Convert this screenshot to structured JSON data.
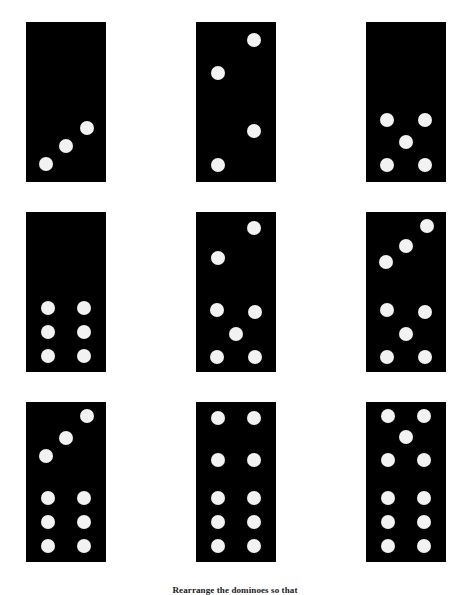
{
  "page": {
    "background_color": "#ffffff",
    "width": 470,
    "height": 595
  },
  "caption": {
    "text": "Rearrange the dominoes so that"
  },
  "style": {
    "tile_color": "#000000",
    "pip_color": "#f2f2f2"
  },
  "puzzle": {
    "type": "domino-grid",
    "rows": 3,
    "columns": 3,
    "tile_count": 9
  },
  "dominoes": [
    {
      "index": 1,
      "row": 1,
      "col": 1,
      "x": 26,
      "y": 22,
      "w": 80,
      "h": 160,
      "top_value": 0,
      "bottom_value": 3,
      "total": 3,
      "top_layout": "blank",
      "bottom_layout": "diagonal-3-up",
      "top_pips": [],
      "bottom_pips": [
        [
          0.25,
          0.78
        ],
        [
          0.5,
          0.55
        ],
        [
          0.76,
          0.33
        ]
      ]
    },
    {
      "index": 2,
      "row": 1,
      "col": 2,
      "x": 196,
      "y": 22,
      "w": 80,
      "h": 160,
      "top_value": 2,
      "bottom_value": 2,
      "total": 4,
      "top_layout": "diagonal-2",
      "bottom_layout": "diagonal-2",
      "top_pips": [
        [
          0.73,
          0.23
        ],
        [
          0.27,
          0.64
        ]
      ],
      "bottom_pips": [
        [
          0.73,
          0.36
        ],
        [
          0.27,
          0.79
        ]
      ]
    },
    {
      "index": 3,
      "row": 1,
      "col": 3,
      "x": 366,
      "y": 22,
      "w": 80,
      "h": 160,
      "top_value": 0,
      "bottom_value": 5,
      "total": 5,
      "top_layout": "blank",
      "bottom_layout": "quincunx-5",
      "top_pips": [],
      "bottom_pips": [
        [
          0.26,
          0.23
        ],
        [
          0.74,
          0.23
        ],
        [
          0.5,
          0.5
        ],
        [
          0.26,
          0.79
        ],
        [
          0.74,
          0.79
        ]
      ]
    },
    {
      "index": 4,
      "row": 2,
      "col": 1,
      "x": 26,
      "y": 212,
      "w": 80,
      "h": 160,
      "top_value": 0,
      "bottom_value": 6,
      "total": 6,
      "top_layout": "blank",
      "bottom_layout": "two-columns-6",
      "top_pips": [],
      "bottom_pips": [
        [
          0.27,
          0.2
        ],
        [
          0.73,
          0.2
        ],
        [
          0.27,
          0.5
        ],
        [
          0.73,
          0.5
        ],
        [
          0.27,
          0.8
        ],
        [
          0.73,
          0.8
        ]
      ]
    },
    {
      "index": 5,
      "row": 2,
      "col": 2,
      "x": 196,
      "y": 212,
      "w": 80,
      "h": 160,
      "top_value": 2,
      "bottom_value": 5,
      "total": 7,
      "top_layout": "diagonal-2",
      "bottom_layout": "quincunx-5",
      "top_pips": [
        [
          0.73,
          0.2
        ],
        [
          0.27,
          0.57
        ]
      ],
      "bottom_pips": [
        [
          0.26,
          0.22
        ],
        [
          0.74,
          0.25
        ],
        [
          0.5,
          0.53
        ],
        [
          0.26,
          0.81
        ],
        [
          0.74,
          0.81
        ]
      ]
    },
    {
      "index": 6,
      "row": 2,
      "col": 3,
      "x": 366,
      "y": 212,
      "w": 80,
      "h": 160,
      "top_value": 3,
      "bottom_value": 5,
      "total": 8,
      "top_layout": "diagonal-3-up",
      "bottom_layout": "quincunx-5",
      "top_pips": [
        [
          0.76,
          0.18
        ],
        [
          0.5,
          0.42
        ],
        [
          0.25,
          0.62
        ]
      ],
      "bottom_pips": [
        [
          0.26,
          0.22
        ],
        [
          0.74,
          0.25
        ],
        [
          0.5,
          0.53
        ],
        [
          0.26,
          0.81
        ],
        [
          0.74,
          0.81
        ]
      ]
    },
    {
      "index": 7,
      "row": 3,
      "col": 1,
      "x": 26,
      "y": 402,
      "w": 80,
      "h": 160,
      "top_value": 3,
      "bottom_value": 6,
      "total": 9,
      "top_layout": "diagonal-3-up",
      "bottom_layout": "two-columns-6",
      "top_pips": [
        [
          0.76,
          0.18
        ],
        [
          0.5,
          0.45
        ],
        [
          0.25,
          0.68
        ]
      ],
      "bottom_pips": [
        [
          0.27,
          0.2
        ],
        [
          0.73,
          0.2
        ],
        [
          0.27,
          0.5
        ],
        [
          0.73,
          0.5
        ],
        [
          0.27,
          0.8
        ],
        [
          0.73,
          0.8
        ]
      ]
    },
    {
      "index": 8,
      "row": 3,
      "col": 2,
      "x": 196,
      "y": 402,
      "w": 80,
      "h": 160,
      "top_value": 4,
      "bottom_value": 6,
      "total": 10,
      "top_layout": "square-4",
      "bottom_layout": "two-columns-6",
      "top_pips": [
        [
          0.27,
          0.2
        ],
        [
          0.73,
          0.2
        ],
        [
          0.27,
          0.72
        ],
        [
          0.73,
          0.72
        ]
      ],
      "bottom_pips": [
        [
          0.27,
          0.2
        ],
        [
          0.73,
          0.2
        ],
        [
          0.27,
          0.5
        ],
        [
          0.73,
          0.5
        ],
        [
          0.27,
          0.8
        ],
        [
          0.73,
          0.8
        ]
      ]
    },
    {
      "index": 9,
      "row": 3,
      "col": 3,
      "x": 366,
      "y": 402,
      "w": 80,
      "h": 160,
      "top_value": 5,
      "bottom_value": 6,
      "total": 11,
      "top_layout": "quincunx-5",
      "bottom_layout": "two-columns-6",
      "top_pips": [
        [
          0.27,
          0.18
        ],
        [
          0.73,
          0.18
        ],
        [
          0.5,
          0.44
        ],
        [
          0.27,
          0.72
        ],
        [
          0.73,
          0.72
        ]
      ],
      "bottom_pips": [
        [
          0.27,
          0.2
        ],
        [
          0.73,
          0.2
        ],
        [
          0.27,
          0.5
        ],
        [
          0.73,
          0.5
        ],
        [
          0.27,
          0.8
        ],
        [
          0.73,
          0.8
        ]
      ]
    }
  ]
}
